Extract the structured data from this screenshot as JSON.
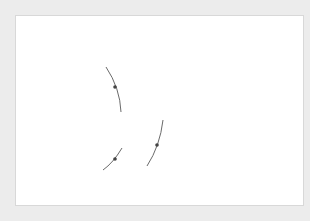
{
  "diagram": {
    "type": "homothety-construction",
    "colors": {
      "background": "#ececec",
      "paper": "#ffffff",
      "grid": "#b0b0b0",
      "lines": "#6a6a6a",
      "triangle_fill": "#d9d9d9",
      "points": "#444444",
      "labels": "#333333"
    },
    "grid": {
      "x0": 18,
      "y0": 16,
      "spacing": 14,
      "width": 287,
      "height": 189
    },
    "points": {
      "O": {
        "label": "O",
        "x": 59,
        "y": 116
      },
      "A": {
        "label": "A",
        "x": 88,
        "y": 101
      },
      "B": {
        "label": "B",
        "x": 88,
        "y": 137
      },
      "C": {
        "label": "C",
        "x": 108,
        "y": 129
      },
      "A_prime": {
        "label": "A'",
        "x": 143,
        "y": 73
      },
      "B_prime": {
        "label": "B'",
        "x": 143,
        "y": 180
      },
      "C_prime": {
        "label": "C'",
        "x": 206,
        "y": 159
      }
    },
    "rays": [
      {
        "name": "ray-OA",
        "from": "O",
        "to_x": 241,
        "to_y": 24
      },
      {
        "name": "ray-OB",
        "from": "O",
        "to_x": 167,
        "to_y": 205
      },
      {
        "name": "ray-OC",
        "from": "O",
        "to_x": 278,
        "to_y": 181
      }
    ],
    "triangle": [
      "A",
      "B",
      "C"
    ],
    "labels": {
      "O": "O",
      "A": "A",
      "B": "B",
      "C": "C",
      "A_prime": "A'",
      "B_prime": "B'",
      "C_prime": "C'"
    }
  }
}
